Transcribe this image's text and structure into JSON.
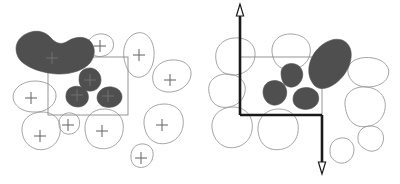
{
  "figure": {
    "background_color": "#ffffff",
    "panel_count": 2
  },
  "style": {
    "blob_fill_color": "#4f4f4f",
    "blob_outline_color": "#9a9a9a",
    "outline_blob_fill": "none",
    "cross_color": "#6d6d6d",
    "thin_rect_color": "#8a8a8a",
    "axis_color": "#1a1a1a",
    "thin_stroke_width": "0.9",
    "axis_stroke_width": "2.6"
  },
  "panels": [
    {
      "id": "panel-left",
      "name": "left-panel",
      "label": "",
      "window_rect": {
        "x": 48,
        "y": 57,
        "width": 80,
        "height": 58,
        "stroke": "#8a8a8a",
        "fill": "none"
      },
      "has_axes": false,
      "filled_blobs": [
        {
          "id": "big-blob-topleft",
          "cross": [
            52,
            58
          ],
          "path": "M 18,57 C 13,46 18,37 28,33 C 37,29 46,32 51,38 C 56,44 62,45 68,41 C 76,36 86,36 91,42 C 96,48 95,57 90,63 C 84,70 72,74 60,74 C 45,74 24,68 18,57 Z"
        },
        {
          "id": "blob-mid-upper",
          "cross": [
            90,
            80
          ],
          "path": "M 83,70 C 89,66 97,68 100,75 C 103,82 99,90 92,91 C 85,92 79,87 79,80 C 79,75 80,72 83,70 Z"
        },
        {
          "id": "blob-lower-left",
          "cross": [
            77,
            95
          ],
          "path": "M 70,88 C 77,84 86,87 88,94 C 90,101 85,107 78,107 C 70,107 65,101 66,95 C 66,92 68,89 70,88 Z"
        },
        {
          "id": "blob-lower-right",
          "cross": [
            108,
            96
          ],
          "path": "M 97,98 C 97,91 104,86 112,87 C 120,88 124,95 121,101 C 118,107 109,109 102,106 C 99,104 97,101 97,98 Z"
        }
      ],
      "outline_blobs": [
        {
          "id": "outline-top-1",
          "cross": [
            100,
            46
          ],
          "path": "M 88,45 C 88,38 95,33 103,34 C 111,35 115,41 113,48 C 111,54 103,58 96,56 C 91,54 88,50 88,45 Z"
        },
        {
          "id": "outline-topright",
          "cross": [
            139,
            55
          ],
          "path": "M 124,58 C 122,46 128,35 137,33 C 146,31 153,39 154,51 C 155,63 150,75 141,77 C 132,79 126,70 124,58 Z"
        },
        {
          "id": "outline-right-1",
          "cross": [
            170,
            80
          ],
          "path": "M 153,81 C 151,70 159,61 171,60 C 184,59 192,66 191,75 C 190,85 179,93 167,92 C 159,91 154,87 153,81 Z"
        },
        {
          "id": "outline-left-1",
          "cross": [
            31,
            98
          ],
          "path": "M 13,97 C 13,88 23,81 35,81 C 48,81 57,88 56,97 C 55,106 45,113 33,112 C 22,112 13,105 13,97 Z"
        },
        {
          "id": "outline-bottomleft",
          "cross": [
            40,
            136
          ],
          "path": "M 22,131 C 21,120 30,112 42,112 C 55,112 62,121 60,133 C 58,145 47,152 36,149 C 27,146 23,140 22,131 Z"
        },
        {
          "id": "outline-small-mid",
          "cross": [
            68,
            125
          ],
          "path": "M 59,125 C 58,117 64,112 71,113 C 78,114 81,120 79,127 C 77,133 70,136 64,133 C 61,131 59,128 59,125 Z"
        },
        {
          "id": "outline-bottom-mid",
          "cross": [
            102,
            131
          ],
          "path": "M 85,130 C 84,118 92,109 104,109 C 117,109 125,118 123,131 C 121,144 110,151 98,148 C 89,146 86,139 85,130 Z"
        },
        {
          "id": "outline-bottom-right",
          "cross": [
            162,
            125
          ],
          "path": "M 144,124 C 143,112 152,104 164,104 C 177,104 185,113 183,126 C 181,139 169,146 157,143 C 148,140 145,132 144,124 Z"
        },
        {
          "id": "outline-small-bottom",
          "cross": [
            141,
            158
          ],
          "path": "M 131,158 C 130,149 136,143 144,144 C 152,145 155,152 152,160 C 149,167 140,170 134,165 C 132,163 131,160 131,158 Z"
        }
      ],
      "crosses": [
        [
          52,
          58
        ],
        [
          90,
          80
        ],
        [
          77,
          95
        ],
        [
          108,
          96
        ],
        [
          100,
          46
        ],
        [
          139,
          55
        ],
        [
          170,
          80
        ],
        [
          31,
          98
        ],
        [
          40,
          136
        ],
        [
          68,
          125
        ],
        [
          102,
          131
        ],
        [
          162,
          125
        ],
        [
          141,
          158
        ]
      ]
    },
    {
      "id": "panel-right",
      "name": "right-panel",
      "label": "",
      "window_rect": {
        "x": 240,
        "y": 57,
        "width": 82,
        "height": 58,
        "stroke": "#8a8a8a",
        "fill": "none"
      },
      "has_axes": true,
      "axes": {
        "vertical_axis": {
          "x": 240,
          "y_top": 4,
          "y_bottom": 115,
          "arrow": "up",
          "arrow_tip": [
            240,
            4
          ]
        },
        "horizontal_axis": {
          "y": 115,
          "x_left": 240,
          "x_right": 322
        },
        "descender_axis": {
          "x": 322,
          "y_top": 115,
          "y_bottom": 174,
          "arrow": "down",
          "arrow_tip": [
            322,
            174
          ]
        }
      },
      "filled_blobs": [
        {
          "id": "big-ellipse-right",
          "cross": null,
          "path": "M 312,82 C 305,71 310,54 322,45 C 334,36 346,38 350,48 C 354,58 348,74 336,83 C 325,91 316,90 312,82 Z"
        },
        {
          "id": "blob-upper-mid",
          "cross": null,
          "path": "M 281,73 C 281,66 288,62 295,64 C 302,66 305,74 301,81 C 297,88 289,89 284,84 C 282,81 281,77 281,73 Z"
        },
        {
          "id": "blob-left-lower",
          "cross": null,
          "path": "M 263,92 C 263,84 270,79 278,81 C 286,83 289,92 285,99 C 281,106 272,107 267,102 C 264,99 263,95 263,92 Z"
        },
        {
          "id": "blob-bottom-mid",
          "cross": null,
          "path": "M 293,99 C 293,91 301,86 310,88 C 318,90 321,98 317,104 C 313,110 303,111 297,107 C 294,105 293,102 293,99 Z"
        }
      ],
      "outline_blobs": [
        {
          "id": "r-outline-topleft",
          "cross": null,
          "path": "M 216,60 C 214,48 222,39 234,38 C 247,37 256,44 255,56 C 254,68 243,76 231,75 C 222,74 217,68 216,60 Z"
        },
        {
          "id": "r-outline-top-mid",
          "cross": null,
          "path": "M 272,52 C 271,41 280,33 292,34 C 305,35 312,43 310,54 C 308,65 297,71 285,69 C 276,67 273,60 272,52 Z"
        },
        {
          "id": "r-outline-left-lower",
          "cross": null,
          "path": "M 209,92 C 207,82 215,74 227,74 C 239,74 247,82 245,92 C 243,103 232,109 221,107 C 213,105 210,99 209,92 Z"
        },
        {
          "id": "r-outline-right-mid",
          "cross": null,
          "path": "M 348,68 C 350,60 361,56 373,58 C 385,60 391,68 388,76 C 385,85 372,89 360,86 C 351,83 347,75 348,68 Z"
        },
        {
          "id": "r-outline-right-lower",
          "cross": null,
          "path": "M 345,105 C 344,94 353,86 366,87 C 379,88 387,97 385,109 C 383,122 371,129 358,126 C 349,123 346,114 345,105 Z"
        },
        {
          "id": "r-outline-bottomleft",
          "cross": null,
          "path": "M 212,128 C 211,116 220,107 233,107 C 246,107 254,117 252,130 C 250,143 238,150 226,147 C 217,144 213,136 212,128 Z"
        },
        {
          "id": "r-outline-bottom-mid",
          "cross": null,
          "path": "M 258,131 C 257,118 266,109 279,109 C 292,109 300,119 298,132 C 296,145 284,152 271,149 C 262,146 259,139 258,131 Z"
        },
        {
          "id": "r-outline-bottom-small",
          "cross": null,
          "path": "M 330,152 C 329,143 336,137 344,138 C 352,139 356,147 353,155 C 350,163 340,166 334,160 C 331,158 330,155 330,152 Z"
        },
        {
          "id": "r-outline-bottom-right",
          "cross": null,
          "path": "M 358,139 C 357,131 364,125 372,126 C 381,127 385,134 383,142 C 381,150 372,154 365,149 C 360,146 358,143 358,139 Z"
        }
      ],
      "crosses": []
    }
  ]
}
